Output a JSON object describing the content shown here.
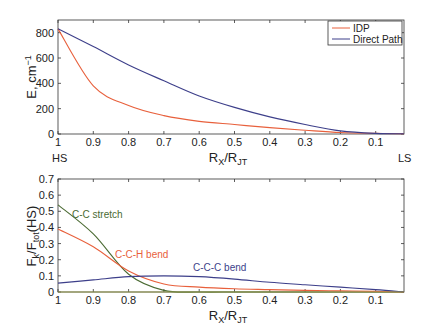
{
  "chart_data": [
    {
      "type": "line",
      "title": "",
      "xlabel": "R_X/R_JT",
      "ylabel": "E, cm^-1",
      "xlim": [
        1.0,
        0.02
      ],
      "ylim": [
        0,
        900
      ],
      "x_reversed": true,
      "xticks": [
        "1",
        "0.9",
        "0.8",
        "0.7",
        "0.6",
        "0.5",
        "0.4",
        "0.3",
        "0.2",
        "0.1"
      ],
      "yticks": [
        "0",
        "200",
        "400",
        "600",
        "800"
      ],
      "grid": false,
      "legend_position": "upper right",
      "end_labels": {
        "left": "HS",
        "right": "LS"
      },
      "x": [
        1.0,
        0.9,
        0.8,
        0.7,
        0.6,
        0.5,
        0.4,
        0.3,
        0.2,
        0.1,
        0.02
      ],
      "series": [
        {
          "name": "IDP",
          "color": "#e8603c",
          "values": [
            830,
            380,
            225,
            145,
            100,
            75,
            50,
            30,
            12,
            5,
            2
          ]
        },
        {
          "name": "Direct Path",
          "color": "#3d3f8a",
          "values": [
            830,
            690,
            545,
            420,
            300,
            210,
            135,
            75,
            25,
            5,
            2
          ]
        }
      ]
    },
    {
      "type": "line",
      "title": "",
      "xlabel": "R_X/R_JT",
      "ylabel": "F_k/F_tot(HS)",
      "xlim": [
        1.0,
        0.02
      ],
      "ylim": [
        0,
        0.7
      ],
      "x_reversed": true,
      "xticks": [
        "1",
        "0.9",
        "0.8",
        "0.7",
        "0.6",
        "0.5",
        "0.4",
        "0.3",
        "0.2",
        "0.1"
      ],
      "yticks": [
        "0",
        "0.1",
        "0.2",
        "0.3",
        "0.4",
        "0.5",
        "0.6",
        "0.7"
      ],
      "grid": false,
      "x": [
        1.0,
        0.9,
        0.8,
        0.7,
        0.6,
        0.5,
        0.4,
        0.3,
        0.2,
        0.1,
        0.02
      ],
      "series": [
        {
          "name": "C-C stretch",
          "color": "#4a6a32",
          "values": [
            0.54,
            0.36,
            0.11,
            0.01,
            0.0,
            0.0,
            0.0,
            0.0,
            0.0,
            0.0,
            0.0
          ]
        },
        {
          "name": "C-C-H bend",
          "color": "#e8603c",
          "values": [
            0.39,
            0.28,
            0.13,
            0.05,
            0.03,
            0.02,
            0.015,
            0.01,
            0.007,
            0.004,
            0.0
          ]
        },
        {
          "name": "C-C-C bend",
          "color": "#3d3f8a",
          "values": [
            0.055,
            0.075,
            0.095,
            0.1,
            0.095,
            0.08,
            0.06,
            0.045,
            0.03,
            0.015,
            0.0
          ]
        },
        {
          "name": "baseline",
          "color": "#9aa050",
          "values": [
            0.0,
            0.0,
            0.0,
            0.0,
            0.0,
            0.0,
            0.0,
            0.0,
            0.0,
            0.0,
            0.0
          ]
        }
      ],
      "annotations": [
        {
          "text": "C-C stretch",
          "x": 0.95,
          "y": 0.47
        },
        {
          "text": "C-C-H bend",
          "x": 0.8,
          "y": 0.21
        },
        {
          "text": "C-C-C bend",
          "x": 0.5,
          "y": 0.16
        }
      ]
    }
  ],
  "top": {
    "ylabel": "E, cm",
    "ylabel_sup": "−1",
    "xlabel_main": "R",
    "xlabel_sub1": "X",
    "xlabel_slash": "/R",
    "xlabel_sub2": "JT",
    "hs": "HS",
    "ls": "LS",
    "legend": [
      {
        "label": "IDP"
      },
      {
        "label": "Direct Path"
      }
    ]
  },
  "bottom": {
    "ylabel_a": "F",
    "ylabel_sub_a": "k",
    "ylabel_b": "/F",
    "ylabel_sub_b": "tot",
    "ylabel_c": "(HS)",
    "xlabel_main": "R",
    "xlabel_sub1": "X",
    "xlabel_slash": "/R",
    "xlabel_sub2": "JT",
    "labels": {
      "cc_stretch": "C-C stretch",
      "cch_bend": "C-C-H bend",
      "ccc_bend": "C-C-C bend"
    }
  }
}
